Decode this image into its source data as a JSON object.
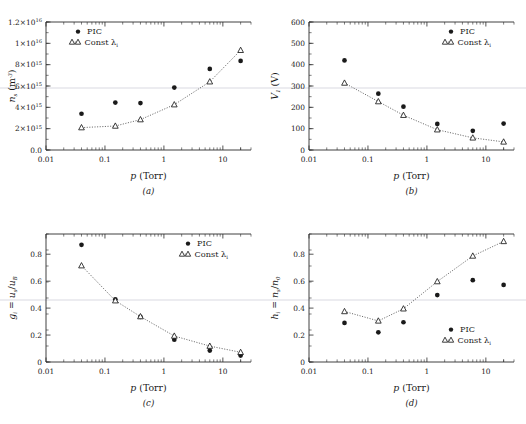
{
  "figure": {
    "panels": [
      "a",
      "b",
      "c",
      "d"
    ],
    "caption_a": "(a)",
    "caption_b": "(b)",
    "caption_c": "(c)",
    "caption_d": "(d)",
    "xlabel": "p (Torr)",
    "legend": {
      "pic": "PIC",
      "const": "Const λ",
      "const_sub": "i"
    },
    "colors": {
      "ink": "#1a1a1a",
      "axis": "#2b2b2b",
      "hairline": "#c9c9d4"
    }
  },
  "chart_data": [
    {
      "type": "scatter",
      "panel": "a",
      "title": "",
      "xlabel": "p (Torr)",
      "ylabel": "n_s (m^-3)",
      "ylabel_parts": {
        "sym": "n",
        "sub": "s",
        "unit": "(m",
        "unit_sup": "-3",
        "unit_end": ")"
      },
      "xscale": "log",
      "xlim": [
        0.01,
        30
      ],
      "ylim": [
        0,
        1.2e+16
      ],
      "xticks": [
        0.01,
        0.1,
        1,
        10
      ],
      "xticklabels": [
        "0.01",
        "0.1",
        "1",
        "10"
      ],
      "yticks": [
        0,
        2000000000000000.0,
        4000000000000000.0,
        6000000000000000.0,
        8000000000000000.0,
        1e+16,
        1.2e+16
      ],
      "yticklabels": [
        "0.0",
        "2×10^15",
        "4×10^15",
        "6×10^15",
        "8×10^15",
        "1×10^16",
        "1.2×10^16"
      ],
      "grid": false,
      "legend_position": "upper-left",
      "series": [
        {
          "name": "PIC",
          "marker": "filled-circle",
          "line": false,
          "x": [
            0.04,
            0.15,
            0.4,
            1.5,
            6,
            20
          ],
          "y": [
            3400000000000000.0,
            4450000000000000.0,
            4400000000000000.0,
            5850000000000000.0,
            7600000000000000.0,
            8350000000000000.0
          ]
        },
        {
          "name": "Const λ_i",
          "marker": "open-triangle",
          "line": true,
          "x": [
            0.04,
            0.15,
            0.4,
            1.5,
            6,
            20
          ],
          "y": [
            2100000000000000.0,
            2250000000000000.0,
            2850000000000000.0,
            4250000000000000.0,
            6400000000000000.0,
            9350000000000000.0
          ]
        }
      ]
    },
    {
      "type": "scatter",
      "panel": "b",
      "title": "",
      "xlabel": "p (Torr)",
      "ylabel": "V_1 (V)",
      "ylabel_parts": {
        "sym": "V",
        "sub": "1",
        "unit": "(V)"
      },
      "xscale": "log",
      "xlim": [
        0.01,
        30
      ],
      "ylim": [
        0,
        600
      ],
      "xticks": [
        0.01,
        0.1,
        1,
        10
      ],
      "xticklabels": [
        "0.01",
        "0.1",
        "1",
        "10"
      ],
      "yticks": [
        0,
        100,
        200,
        300,
        400,
        500,
        600
      ],
      "yticklabels": [
        "0",
        "100",
        "200",
        "300",
        "400",
        "500",
        "600"
      ],
      "grid": false,
      "legend_position": "upper-right",
      "series": [
        {
          "name": "PIC",
          "marker": "filled-circle",
          "line": false,
          "x": [
            0.04,
            0.15,
            0.4,
            1.5,
            6,
            20
          ],
          "y": [
            420,
            264,
            203,
            122,
            90,
            124
          ]
        },
        {
          "name": "Const λ_i",
          "marker": "open-triangle",
          "line": true,
          "x": [
            0.04,
            0.15,
            0.4,
            1.5,
            6,
            20
          ],
          "y": [
            314,
            227,
            163,
            95,
            57,
            38
          ]
        }
      ]
    },
    {
      "type": "scatter",
      "panel": "c",
      "title": "",
      "xlabel": "p (Torr)",
      "ylabel": "g_i = u_s / u_B",
      "ylabel_parts": {
        "sym": "g",
        "sub": "i",
        "eq": " = ",
        "num": "u",
        "numsub": "s",
        "den": "u",
        "densub": "B"
      },
      "xscale": "log",
      "xlim": [
        0.01,
        30
      ],
      "ylim": [
        0,
        0.95
      ],
      "xticks": [
        0.01,
        0.1,
        1,
        10
      ],
      "xticklabels": [
        "0.01",
        "0.1",
        "1",
        "10"
      ],
      "yticks": [
        0,
        0.2,
        0.4,
        0.6,
        0.8
      ],
      "yticklabels": [
        "0",
        "0.2",
        "0.4",
        "0.6",
        "0.8"
      ],
      "grid": false,
      "legend_position": "upper-right",
      "series": [
        {
          "name": "PIC",
          "marker": "filled-circle",
          "line": false,
          "x": [
            0.04,
            0.15,
            0.4,
            1.5,
            6,
            20
          ],
          "y": [
            0.87,
            0.465,
            0.335,
            0.165,
            0.085,
            0.048
          ]
        },
        {
          "name": "Const λ_i",
          "marker": "open-triangle",
          "line": true,
          "x": [
            0.04,
            0.15,
            0.4,
            1.5,
            6,
            20
          ],
          "y": [
            0.715,
            0.455,
            0.337,
            0.193,
            0.118,
            0.072
          ]
        }
      ]
    },
    {
      "type": "scatter",
      "panel": "d",
      "title": "",
      "xlabel": "p (Torr)",
      "ylabel": "h_i = n_s / n_0",
      "ylabel_parts": {
        "sym": "h",
        "sub": "i",
        "eq": " = ",
        "num": "n",
        "numsub": "s",
        "den": "n",
        "densub": "0"
      },
      "xscale": "log",
      "xlim": [
        0.01,
        30
      ],
      "ylim": [
        0,
        0.95
      ],
      "xticks": [
        0.01,
        0.1,
        1,
        10
      ],
      "xticklabels": [
        "0.01",
        "0.1",
        "1",
        "10"
      ],
      "yticks": [
        0,
        0.2,
        0.4,
        0.6,
        0.8
      ],
      "yticklabels": [
        "0",
        "0.2",
        "0.4",
        "0.6",
        "0.8"
      ],
      "grid": false,
      "legend_position": "center-right",
      "series": [
        {
          "name": "PIC",
          "marker": "filled-circle",
          "line": false,
          "x": [
            0.04,
            0.15,
            0.4,
            1.5,
            6,
            20
          ],
          "y": [
            0.29,
            0.22,
            0.295,
            0.497,
            0.607,
            0.572
          ]
        },
        {
          "name": "Const λ_i",
          "marker": "open-triangle",
          "line": true,
          "x": [
            0.04,
            0.15,
            0.4,
            1.5,
            6,
            20
          ],
          "y": [
            0.375,
            0.305,
            0.395,
            0.597,
            0.787,
            0.895
          ]
        }
      ]
    }
  ]
}
